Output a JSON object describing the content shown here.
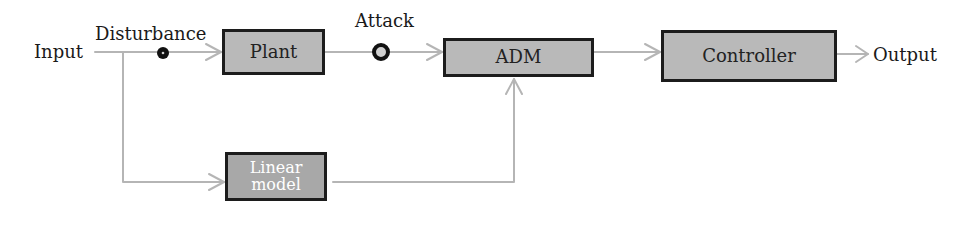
{
  "diagram": {
    "type": "block-diagram",
    "colors": {
      "block_fill": "#b9b9b9",
      "block_border": "#1c1c1c",
      "wire": "#b5b5b5",
      "marker": "#111111"
    },
    "labels": {
      "input": "Input",
      "disturbance": "Disturbance",
      "attack": "Attack",
      "output": "Output"
    },
    "blocks": {
      "plant": "Plant",
      "adm": "ADM",
      "controller": "Controller",
      "linear_model": "Linear model"
    },
    "edges": [
      {
        "from": "Input",
        "to": "Plant",
        "via": "Disturbance"
      },
      {
        "from": "Plant",
        "to": "ADM",
        "via": "Attack"
      },
      {
        "from": "ADM",
        "to": "Controller"
      },
      {
        "from": "Controller",
        "to": "Output"
      },
      {
        "from": "Input",
        "to": "Linear model"
      },
      {
        "from": "Linear model",
        "to": "ADM"
      }
    ]
  }
}
